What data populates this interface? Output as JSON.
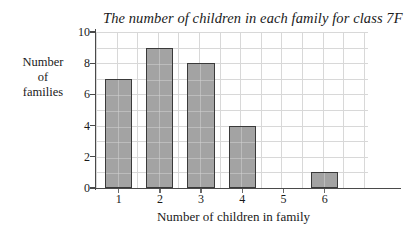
{
  "chart_data": {
    "type": "bar",
    "title": "The number of children in each family for class 7F",
    "xlabel": "Number of children in family",
    "ylabel": "Number\nof\nfamilies",
    "ylabel_lines": [
      "Number",
      "of",
      "families"
    ],
    "categories": [
      "1",
      "2",
      "3",
      "4",
      "5",
      "6"
    ],
    "values": [
      7,
      9,
      8,
      4,
      0,
      1
    ],
    "ylim": [
      0,
      10
    ],
    "ytick_labels": [
      "0",
      "2",
      "4",
      "6",
      "8",
      "10"
    ],
    "ytick_values": [
      0,
      2,
      4,
      6,
      8,
      10
    ],
    "grid": true,
    "grid_horizontal_step": 1,
    "grid_vertical_step": 0.5,
    "legend": null,
    "bar_fill_color": "#a3a3a3",
    "bar_border_color": "#3a3a3a",
    "grid_color": "#d8d8d8",
    "axis_color": "#4a4a4a",
    "background_color": "#ffffff"
  }
}
